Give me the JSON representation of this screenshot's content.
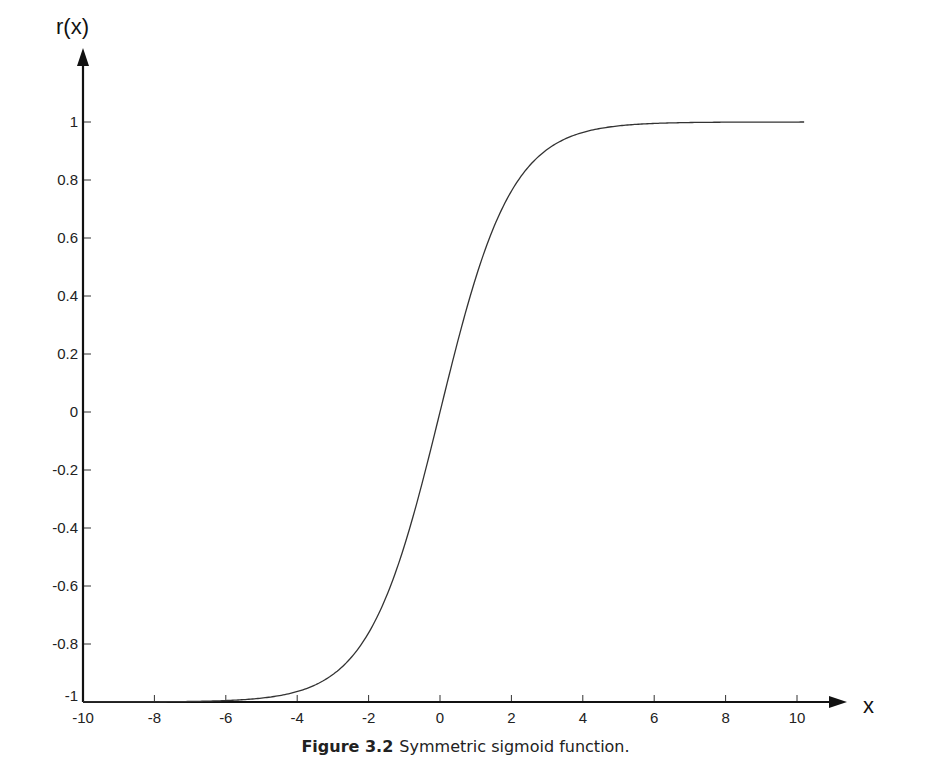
{
  "chart_data": {
    "type": "line",
    "title": "",
    "function": "r(x) = (1 - e^-x) / (1 + e^-x) = tanh(x/2)",
    "xlabel": "x",
    "ylabel": "r(x)",
    "xlim": [
      -10,
      10
    ],
    "ylim": [
      -1,
      1
    ],
    "grid": false,
    "legend": null,
    "x_ticks": [
      -10,
      -8,
      -6,
      -4,
      -2,
      0,
      2,
      4,
      6,
      8,
      10
    ],
    "y_ticks": [
      -1,
      -0.8,
      -0.6,
      -0.4,
      -0.2,
      0,
      0.2,
      0.4,
      0.6,
      0.8,
      1
    ],
    "x_tick_labels": [
      "-10",
      "-8",
      "-6",
      "-4",
      "-2",
      "0",
      "2",
      "4",
      "6",
      "8",
      "10"
    ],
    "y_tick_labels": [
      "-1",
      "-0.8",
      "-0.6",
      "-0.4",
      "-0.2",
      "0",
      "0.2",
      "0.4",
      "0.6",
      "0.8",
      "1"
    ],
    "series": [
      {
        "name": "Symmetric sigmoid",
        "color": "#333333",
        "x": [
          -10,
          -8,
          -6,
          -5,
          -4,
          -3,
          -2,
          -1.5,
          -1,
          -0.5,
          0,
          0.5,
          1,
          1.5,
          2,
          3,
          4,
          5,
          6,
          8,
          10.2
        ],
        "y": [
          -1.0,
          -0.999,
          -0.995,
          -0.987,
          -0.964,
          -0.905,
          -0.762,
          -0.635,
          -0.462,
          -0.245,
          0.0,
          0.245,
          0.462,
          0.635,
          0.762,
          0.905,
          0.964,
          0.987,
          0.995,
          0.999,
          1.0
        ]
      }
    ]
  },
  "caption": {
    "figure_number": "Figure 3.2",
    "text": "Symmetric sigmoid function."
  }
}
